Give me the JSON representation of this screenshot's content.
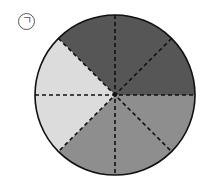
{
  "label": "ㄱ",
  "circle": {
    "sectors_total": 8,
    "sectors": [
      {
        "name": "dark",
        "count": 3,
        "color": "#565656"
      },
      {
        "name": "medium",
        "count": 3,
        "color": "#8e8e8e"
      },
      {
        "name": "light",
        "count": 2,
        "color": "#dcdcdc"
      }
    ]
  }
}
